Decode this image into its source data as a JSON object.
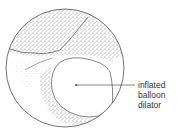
{
  "figure": {
    "label_lines": [
      "inflated",
      "balloon",
      "dilator"
    ],
    "colors": {
      "ink": "#333333",
      "background": "#ffffff"
    }
  }
}
